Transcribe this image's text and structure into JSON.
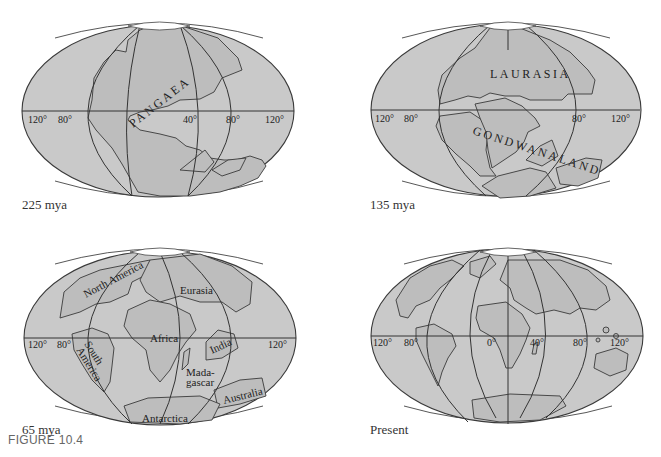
{
  "figure": {
    "label": "FIGURE 10.4",
    "panels": [
      {
        "id": "225mya",
        "caption": "225 mya",
        "labels": {
          "supercontinent": "PANGAEA"
        },
        "ticks": [
          "120°",
          "80°",
          "40°",
          "80°",
          "120°"
        ]
      },
      {
        "id": "135mya",
        "caption": "135 mya",
        "labels": {
          "north": "LAURASIA",
          "south": "GONDWANALAND"
        },
        "ticks": [
          "120°",
          "80°",
          "80°",
          "120°"
        ]
      },
      {
        "id": "65mya",
        "caption": "65 mya",
        "labels": {
          "north_america": "North America",
          "eurasia": "Eurasia",
          "africa": "Africa",
          "south_america_1": "South",
          "south_america_2": "America",
          "india": "India",
          "madagascar_1": "Mada-",
          "madagascar_2": "gascar",
          "australia": "Australia",
          "antarctica": "Antarctica"
        },
        "ticks": [
          "120°",
          "80°",
          "120°"
        ]
      },
      {
        "id": "present",
        "caption": "Present",
        "labels": {},
        "ticks": [
          "120°",
          "80°",
          "0°",
          "40°",
          "80°",
          "120°"
        ]
      }
    ]
  },
  "colors": {
    "ocean": "#c9c9c9",
    "land": "#bdbdbd",
    "outline": "#3a3a3a",
    "background": "#ffffff"
  }
}
